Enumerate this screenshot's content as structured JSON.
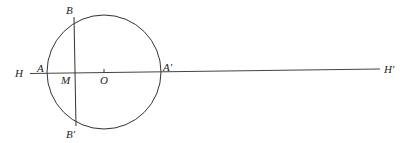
{
  "diagram": {
    "type": "geometry",
    "colors": {
      "stroke": "#333333",
      "text": "#222222",
      "background": "#ffffff"
    },
    "circle": {
      "cx": 104,
      "cy": 72,
      "r": 57,
      "center_label": "O"
    },
    "line": {
      "x1": 30,
      "y1": 73.5,
      "x2": 380,
      "y2": 69,
      "start_label": "H",
      "end_label": "H′"
    },
    "chord": {
      "x1": 74,
      "y1": 17,
      "x2": 76,
      "y2": 126
    },
    "labels": {
      "H": "H",
      "A": "A",
      "M": "M",
      "O": "O",
      "A_prime": "A′",
      "B": "B",
      "B_prime": "B′",
      "H_prime": "H′"
    }
  }
}
